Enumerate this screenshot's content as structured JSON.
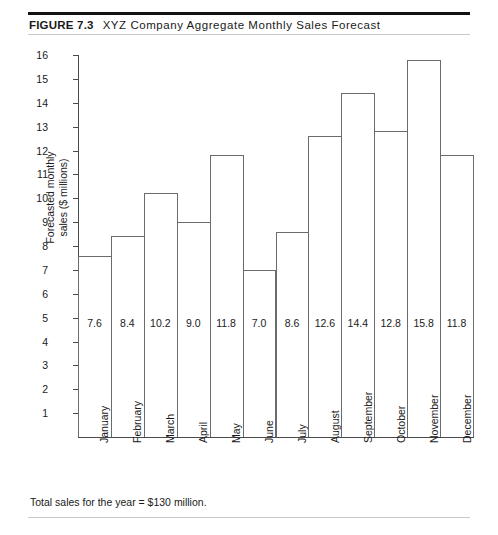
{
  "figure": {
    "label": "FIGURE 7.3",
    "title": "XYZ Company Aggregate Monthly Sales Forecast",
    "footnote": "Total sales for the year = $130 million."
  },
  "chart_data": {
    "type": "bar",
    "title": "XYZ Company Aggregate Monthly Sales Forecast",
    "xlabel": "",
    "ylabel": "Forecasted monthly sales ($ millions)",
    "ylabel_line1": "Forecasted monthly",
    "ylabel_line2": "sales ($ millions)",
    "categories": [
      "January",
      "February",
      "March",
      "April",
      "May",
      "June",
      "July",
      "August",
      "September",
      "October",
      "November",
      "December"
    ],
    "values": [
      7.6,
      8.4,
      10.2,
      9.0,
      11.8,
      7.0,
      8.6,
      12.6,
      14.4,
      12.8,
      15.8,
      11.8
    ],
    "value_labels": [
      "7.6",
      "8.4",
      "10.2",
      "9.0",
      "11.8",
      "7.0",
      "8.6",
      "12.6",
      "14.4",
      "12.8",
      "15.8",
      "11.8"
    ],
    "ylim": [
      0,
      16
    ],
    "yticks": [
      1,
      2,
      3,
      4,
      5,
      6,
      7,
      8,
      9,
      10,
      11,
      12,
      13,
      14,
      15,
      16
    ],
    "ytick_labels": [
      "1",
      "2",
      "3",
      "4",
      "5",
      "6",
      "7",
      "8",
      "9",
      "10",
      "11",
      "12",
      "13",
      "14",
      "15",
      "16"
    ],
    "grid": false,
    "legend": null,
    "bar_style": "contiguous-outline",
    "colors": {
      "bar_outline": "#6b6b6b",
      "bar_fill": "transparent",
      "axis": "#4a4a4a",
      "text": "#1a1a1a",
      "rule_heavy": "#111111",
      "rule_light": "#c9c9c9"
    }
  }
}
